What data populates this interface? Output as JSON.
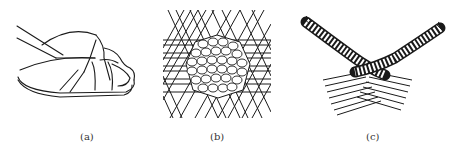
{
  "figure": {
    "panels": [
      {
        "id": "a",
        "label": "(a)",
        "subject": "woven sandal toe strap illustration"
      },
      {
        "id": "b",
        "label": "(b)",
        "subject": "hexagonal plaiting weave pattern"
      },
      {
        "id": "c",
        "label": "(c)",
        "subject": "crossed braided strands"
      }
    ],
    "stroke_color": "#1a1a1a"
  }
}
